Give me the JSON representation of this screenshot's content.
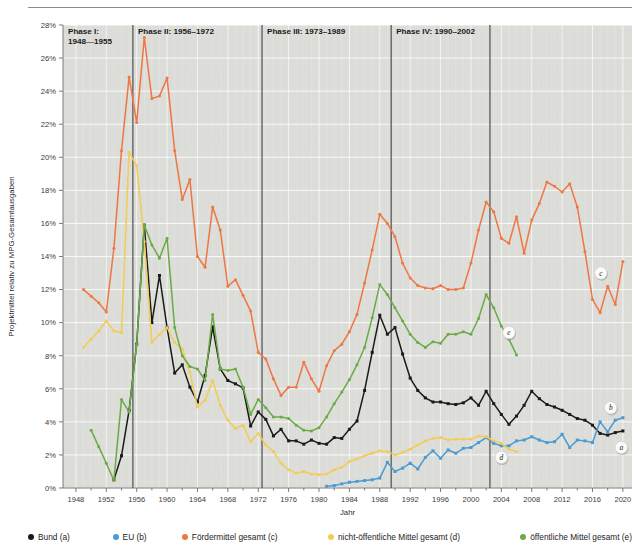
{
  "figure": {
    "plot_background": "#dcdcd8",
    "page_background": "#ffffff",
    "grid_color": "#ffffff",
    "divider_color": "#55555a"
  },
  "axes": {
    "ylabel": "Projektmittel relativ zu MPG-Gesamtausgaben",
    "xlabel": "Jahr",
    "ytick_labels": [
      "0%",
      "2%",
      "4%",
      "6%",
      "8%",
      "10%",
      "12%",
      "14%",
      "16%",
      "18%",
      "20%",
      "22%",
      "24%",
      "26%",
      "28%"
    ],
    "xtick_labels": [
      "1948",
      "1952",
      "1956",
      "1960",
      "1964",
      "1968",
      "1972",
      "1976",
      "1980",
      "1984",
      "1988",
      "1992",
      "1996",
      "2000",
      "2004",
      "2008",
      "2012",
      "2016",
      "2020"
    ]
  },
  "phases": [
    {
      "id": "phase-1",
      "label_line1": "Phase I:",
      "label_line2": "1948—1955",
      "start": 1946.3,
      "end": 1955.5
    },
    {
      "id": "phase-2",
      "label_line1": "Phase II: 1956–1972",
      "label_line2": "",
      "start": 1955.5,
      "end": 1972.5
    },
    {
      "id": "phase-3",
      "label_line1": "Phase III: 1973–1989",
      "label_line2": "",
      "start": 1972.5,
      "end": 1989.5
    },
    {
      "id": "phase-4",
      "label_line1": "Phase IV: 1990–2002",
      "label_line2": "",
      "start": 1989.5,
      "end": 2002.5
    }
  ],
  "series_badges": [
    {
      "id": "badge-c",
      "label": "c",
      "x": 2017.1,
      "y": 13.0
    },
    {
      "id": "badge-e",
      "label": "e",
      "x": 2005.0,
      "y": 9.4
    },
    {
      "id": "badge-b",
      "label": "b",
      "x": 2018.4,
      "y": 4.85
    },
    {
      "id": "badge-d",
      "label": "d",
      "x": 2004.0,
      "y": 1.85
    },
    {
      "id": "badge-a",
      "label": "a",
      "x": 2019.8,
      "y": 2.45
    }
  ],
  "legend": [
    {
      "id": "legend-bund",
      "label": "Bund (a)",
      "color": "#1a1a1a"
    },
    {
      "id": "legend-eu",
      "label": "EU (b)",
      "color": "#4a9bd4"
    },
    {
      "id": "legend-foerdermittel",
      "label": "Fördermittel gesamt (c)",
      "color": "#ee7744"
    },
    {
      "id": "legend-nicht-oeffentlich",
      "label": "nicht-öffentliche Mittel gesamt (d)",
      "color": "#f2cc55"
    },
    {
      "id": "legend-oeffentlich",
      "label": "öffentliche Mittel gesamt (e)",
      "color": "#6aab46"
    }
  ],
  "chart_data": {
    "type": "line",
    "title": "",
    "xlabel": "Jahr",
    "ylabel": "Projektmittel relativ zu MPG-Gesamtausgaben",
    "xlim": [
      1946.3,
      2021.2
    ],
    "ylim": [
      0,
      28
    ],
    "ytick_step": 2,
    "xtick_step": 4,
    "grid": true,
    "legend_position": "below",
    "series": [
      {
        "name": "Bund (a)",
        "key": "a",
        "color": "#1a1a1a",
        "marker": "square",
        "x": [
          1953,
          1954,
          1955,
          1956,
          1957,
          1958,
          1959,
          1960,
          1961,
          1962,
          1963,
          1964,
          1965,
          1966,
          1967,
          1968,
          1969,
          1970,
          1971,
          1972,
          1973,
          1974,
          1975,
          1976,
          1977,
          1978,
          1979,
          1980,
          1981,
          1982,
          1983,
          1984,
          1985,
          1986,
          1987,
          1988,
          1989,
          1990,
          1991,
          1992,
          1993,
          1994,
          1995,
          1996,
          1997,
          1998,
          1999,
          2000,
          2001,
          2002,
          2003,
          2004,
          2005,
          2006,
          2007,
          2008,
          2009,
          2010,
          2011,
          2012,
          2013,
          2014,
          2015,
          2016,
          2017,
          2018,
          2019,
          2020
        ],
        "y": [
          0.5,
          1.95,
          4.7,
          8.7,
          15.9,
          10.0,
          12.85,
          9.7,
          6.95,
          7.45,
          6.1,
          5.2,
          6.8,
          9.75,
          7.2,
          6.5,
          6.3,
          6.05,
          3.75,
          4.6,
          4.15,
          3.15,
          3.55,
          2.85,
          2.85,
          2.65,
          2.9,
          2.7,
          2.65,
          3.05,
          3.0,
          3.55,
          4.05,
          5.9,
          8.2,
          10.45,
          9.3,
          9.7,
          8.1,
          6.65,
          5.9,
          5.45,
          5.2,
          5.2,
          5.1,
          5.05,
          5.15,
          5.45,
          5.0,
          5.85,
          5.1,
          4.45,
          3.85,
          4.35,
          5.0,
          5.85,
          5.4,
          5.05,
          4.9,
          4.7,
          4.45,
          4.2,
          4.1,
          3.8,
          3.3,
          3.2,
          3.35,
          3.45
        ]
      },
      {
        "name": "EU (b)",
        "key": "b",
        "color": "#4a9bd4",
        "marker": "square",
        "x": [
          1981,
          1982,
          1983,
          1984,
          1985,
          1986,
          1987,
          1988,
          1989,
          1990,
          1991,
          1992,
          1993,
          1994,
          1995,
          1996,
          1997,
          1998,
          1999,
          2000,
          2001,
          2002,
          2003,
          2004,
          2005,
          2006,
          2007,
          2008,
          2009,
          2010,
          2011,
          2012,
          2013,
          2014,
          2015,
          2016,
          2017,
          2018,
          2019,
          2020
        ],
        "y": [
          0.1,
          0.15,
          0.25,
          0.35,
          0.4,
          0.45,
          0.5,
          0.6,
          1.55,
          1.0,
          1.2,
          1.5,
          1.15,
          1.85,
          2.25,
          1.8,
          2.3,
          2.1,
          2.4,
          2.45,
          2.75,
          3.05,
          2.7,
          2.55,
          2.55,
          2.85,
          2.9,
          3.1,
          2.9,
          2.75,
          2.8,
          3.25,
          2.45,
          2.9,
          2.85,
          2.75,
          4.0,
          3.4,
          4.1,
          4.25
        ]
      },
      {
        "name": "Fördermittel gesamt (c)",
        "key": "c",
        "color": "#ee7744",
        "marker": "circle",
        "x": [
          1949,
          1950,
          1951,
          1952,
          1953,
          1954,
          1955,
          1956,
          1957,
          1958,
          1959,
          1960,
          1961,
          1962,
          1963,
          1964,
          1965,
          1966,
          1967,
          1968,
          1969,
          1970,
          1971,
          1972,
          1973,
          1974,
          1975,
          1976,
          1977,
          1978,
          1979,
          1980,
          1981,
          1982,
          1983,
          1984,
          1985,
          1986,
          1987,
          1988,
          1989,
          1990,
          1991,
          1992,
          1993,
          1994,
          1995,
          1996,
          1997,
          1998,
          1999,
          2000,
          2001,
          2002,
          2003,
          2004,
          2005,
          2006,
          2007,
          2008,
          2009,
          2010,
          2011,
          2012,
          2013,
          2014,
          2015,
          2016,
          2017,
          2018,
          2019,
          2020
        ],
        "y": [
          12.0,
          11.6,
          11.2,
          10.65,
          14.5,
          20.4,
          24.85,
          22.1,
          27.25,
          23.55,
          23.7,
          24.8,
          20.4,
          17.45,
          18.65,
          14.0,
          13.35,
          17.0,
          15.6,
          12.2,
          12.6,
          11.65,
          10.7,
          8.2,
          7.8,
          6.6,
          5.6,
          6.1,
          6.1,
          7.6,
          6.6,
          5.85,
          7.4,
          8.3,
          8.7,
          9.45,
          10.5,
          12.4,
          14.4,
          16.55,
          16.0,
          15.2,
          13.6,
          12.7,
          12.25,
          12.1,
          12.05,
          12.25,
          12.0,
          12.0,
          12.1,
          13.6,
          15.6,
          17.3,
          16.7,
          15.1,
          14.8,
          16.4,
          14.2,
          16.2,
          17.2,
          18.5,
          18.25,
          17.9,
          18.4,
          17.0,
          14.3,
          11.4,
          10.6,
          12.2,
          11.1,
          13.7
        ]
      },
      {
        "name": "nicht-öffentliche Mittel gesamt (d)",
        "key": "d",
        "color": "#f2cc55",
        "marker": "circle",
        "x": [
          1949,
          1950,
          1951,
          1952,
          1953,
          1954,
          1955,
          1956,
          1957,
          1958,
          1959,
          1960,
          1961,
          1962,
          1963,
          1964,
          1965,
          1966,
          1967,
          1968,
          1969,
          1970,
          1971,
          1972,
          1973,
          1974,
          1975,
          1976,
          1977,
          1978,
          1979,
          1980,
          1981,
          1982,
          1983,
          1984,
          1985,
          1986,
          1987,
          1988,
          1989,
          1990,
          1991,
          1992,
          1993,
          1994,
          1995,
          1996,
          1997,
          1998,
          1999,
          2000,
          2001,
          2002,
          2003,
          2004,
          2005,
          2006
        ],
        "y": [
          8.5,
          9.0,
          9.5,
          10.1,
          9.5,
          9.4,
          20.3,
          19.5,
          14.9,
          8.8,
          9.3,
          9.7,
          8.8,
          8.4,
          7.0,
          4.9,
          5.3,
          6.5,
          5.0,
          4.1,
          3.6,
          3.8,
          2.8,
          3.3,
          2.6,
          2.2,
          1.5,
          1.1,
          0.9,
          1.0,
          0.85,
          0.8,
          0.85,
          1.1,
          1.25,
          1.6,
          1.75,
          1.95,
          2.1,
          2.25,
          2.2,
          2.0,
          2.15,
          2.35,
          2.6,
          2.85,
          3.0,
          3.05,
          2.9,
          2.95,
          2.95,
          2.95,
          3.15,
          3.1,
          2.85,
          2.7,
          2.35,
          2.2
        ]
      },
      {
        "name": "öffentliche Mittel gesamt (e)",
        "key": "e",
        "color": "#6aab46",
        "marker": "circle",
        "x": [
          1950,
          1951,
          1952,
          1953,
          1954,
          1955,
          1956,
          1957,
          1958,
          1959,
          1960,
          1961,
          1962,
          1963,
          1964,
          1965,
          1966,
          1967,
          1968,
          1969,
          1970,
          1971,
          1972,
          1973,
          1974,
          1975,
          1976,
          1977,
          1978,
          1979,
          1980,
          1981,
          1982,
          1983,
          1984,
          1985,
          1986,
          1987,
          1988,
          1989,
          1990,
          1991,
          1992,
          1993,
          1994,
          1995,
          1996,
          1997,
          1998,
          1999,
          2000,
          2001,
          2002,
          2003,
          2004,
          2005,
          2006
        ],
        "y": [
          3.5,
          2.5,
          1.5,
          0.45,
          5.35,
          4.6,
          8.7,
          15.9,
          14.7,
          13.9,
          15.1,
          9.7,
          8.0,
          7.35,
          7.2,
          6.5,
          10.5,
          7.2,
          7.1,
          7.2,
          6.1,
          4.45,
          5.35,
          4.85,
          4.3,
          4.3,
          4.2,
          3.8,
          3.5,
          3.45,
          3.65,
          4.3,
          5.1,
          5.8,
          6.55,
          7.45,
          8.5,
          10.3,
          12.3,
          11.7,
          10.9,
          10.1,
          9.3,
          8.8,
          8.5,
          8.85,
          8.75,
          9.3,
          9.3,
          9.45,
          9.3,
          10.25,
          11.7,
          10.9,
          9.8,
          9.0,
          8.05
        ]
      }
    ]
  }
}
